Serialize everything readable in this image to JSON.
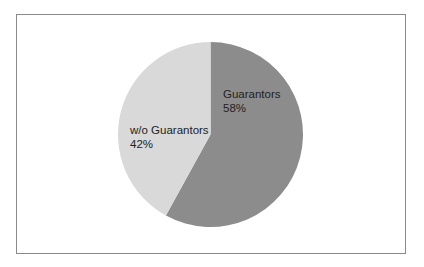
{
  "chart_data": {
    "type": "pie",
    "title": "",
    "categories": [
      "Guarantors",
      "w/o Guarantors"
    ],
    "values": [
      58,
      42
    ],
    "unit": "%",
    "colors": [
      "#8c8c8c",
      "#d9d9d9"
    ],
    "start_angle_deg": 0,
    "direction": "clockwise",
    "legend": "none",
    "data_labels": [
      {
        "name": "Guarantors",
        "value": "58%"
      },
      {
        "name": "w/o Guarantors",
        "value": "42%"
      }
    ]
  },
  "labels": {
    "guarantors": {
      "name": "Guarantors",
      "pct": "58%"
    },
    "without": {
      "name": "w/o Guarantors",
      "pct": "42%"
    }
  }
}
